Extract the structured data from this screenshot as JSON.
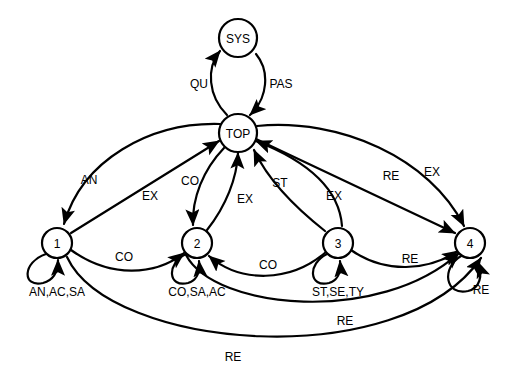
{
  "diagram": {
    "type": "state-transition-diagram",
    "width": 516,
    "height": 387,
    "background_color": "#ffffff",
    "stroke_color": "#000000",
    "nodes": [
      {
        "id": "SYS",
        "label": "SYS",
        "cx": 238,
        "cy": 38,
        "r": 19
      },
      {
        "id": "TOP",
        "label": "TOP",
        "cx": 238,
        "cy": 133,
        "r": 19
      },
      {
        "id": "S1",
        "label": "1",
        "cx": 57,
        "cy": 243,
        "r": 15
      },
      {
        "id": "S2",
        "label": "2",
        "cx": 197,
        "cy": 243,
        "r": 15
      },
      {
        "id": "S3",
        "label": "3",
        "cx": 338,
        "cy": 243,
        "r": 15
      },
      {
        "id": "S4",
        "label": "4",
        "cx": 470,
        "cy": 243,
        "r": 15
      }
    ],
    "edges": [
      {
        "from": "TOP",
        "to": "SYS",
        "label": "QU",
        "label_x": 199,
        "label_y": 84
      },
      {
        "from": "SYS",
        "to": "TOP",
        "label": "PAS",
        "label_x": 281,
        "label_y": 84
      },
      {
        "from": "TOP",
        "to": "S1",
        "label": "AN",
        "label_x": 89,
        "label_y": 180
      },
      {
        "from": "S1",
        "to": "TOP",
        "label": "EX",
        "label_x": 150,
        "label_y": 196
      },
      {
        "from": "TOP",
        "to": "S2",
        "label": "CO",
        "label_x": 190,
        "label_y": 181
      },
      {
        "from": "S2",
        "to": "TOP",
        "label": "EX",
        "label_x": 245,
        "label_y": 199
      },
      {
        "from": "S3",
        "to": "TOP",
        "label": "ST",
        "label_x": 280,
        "label_y": 183
      },
      {
        "from": "S3",
        "to": "TOP",
        "label": "EX",
        "label_x": 334,
        "label_y": 196
      },
      {
        "from": "TOP",
        "to": "S4",
        "label": "RE",
        "label_x": 391,
        "label_y": 176
      },
      {
        "from": "TOP",
        "to": "S4",
        "label": "EX",
        "label_x": 432,
        "label_y": 172
      },
      {
        "from": "S1",
        "to": "S2",
        "label": "CO",
        "label_x": 124,
        "label_y": 257
      },
      {
        "from": "S3",
        "to": "S2",
        "label": "CO",
        "label_x": 268,
        "label_y": 265
      },
      {
        "from": "S3",
        "to": "S4",
        "label": "RE",
        "label_x": 410,
        "label_y": 259
      },
      {
        "from": "S2",
        "to": "S4",
        "label": "RE",
        "label_x": 345,
        "label_y": 321
      },
      {
        "from": "S1",
        "to": "S4",
        "label": "RE",
        "label_x": 233,
        "label_y": 357
      }
    ],
    "self_loops": [
      {
        "node": "S1",
        "label": "AN,AC,SA",
        "label_x": 57,
        "label_y": 292
      },
      {
        "node": "S2",
        "label": "CO,SA,AC",
        "label_x": 197,
        "label_y": 292
      },
      {
        "node": "S3",
        "label": "ST,SE,TY",
        "label_x": 338,
        "label_y": 292
      },
      {
        "node": "S4",
        "label": "RE",
        "label_x": 481,
        "label_y": 290
      }
    ]
  }
}
